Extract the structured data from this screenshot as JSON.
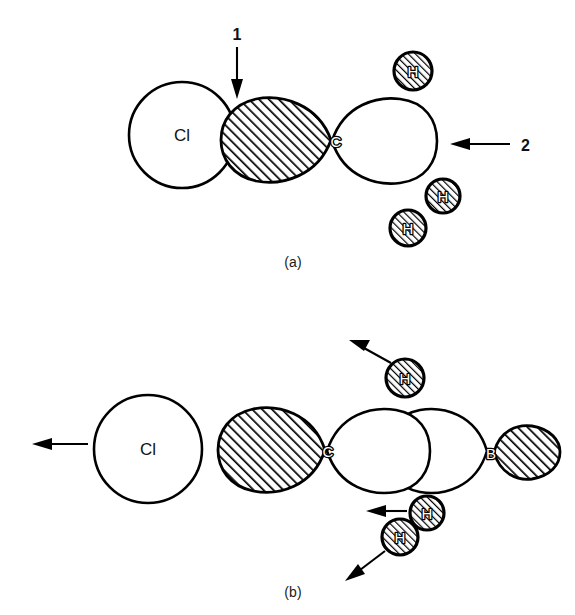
{
  "figure": {
    "background_color": "#ffffff",
    "ink_color": "#000000",
    "panels": [
      {
        "id": "a",
        "caption": "(a)",
        "atoms": [
          {
            "label": "Cl",
            "kind": "circle",
            "fill": "white"
          },
          {
            "label": "C",
            "kind": "orbital-pair",
            "left_lobe_fill": "hatched",
            "right_lobe_fill": "white"
          },
          {
            "label": "H",
            "kind": "small-circle",
            "fill": "hatched"
          },
          {
            "label": "H",
            "kind": "small-circle",
            "fill": "hatched"
          },
          {
            "label": "H",
            "kind": "small-circle",
            "fill": "hatched"
          }
        ],
        "annotations": [
          {
            "text": "1",
            "arrow": "down",
            "points_at": "overlap between Cl and carbon hatched lobe"
          },
          {
            "text": "2",
            "arrow": "left",
            "points_at": "open white lobe of carbon"
          }
        ]
      },
      {
        "id": "b",
        "caption": "(b)",
        "atoms": [
          {
            "label": "Cl",
            "kind": "circle",
            "fill": "white"
          },
          {
            "label": "C",
            "kind": "orbital-pair",
            "left_lobe_fill": "hatched",
            "right_lobe_fill": "white"
          },
          {
            "label": "B",
            "kind": "orbital-pair",
            "left_lobe_fill": "white",
            "right_lobe_fill": "hatched"
          },
          {
            "label": "H",
            "kind": "small-circle",
            "fill": "hatched"
          },
          {
            "label": "H",
            "kind": "small-circle",
            "fill": "hatched"
          },
          {
            "label": "H",
            "kind": "small-circle",
            "fill": "hatched"
          }
        ],
        "annotations": [
          {
            "text": "",
            "arrow": "left",
            "points_at": "chlorine leaving group"
          },
          {
            "text": "",
            "arrow": "up-left",
            "points_at": "upper hydrogen"
          },
          {
            "text": "",
            "arrow": "left",
            "points_at": "middle hydrogen"
          },
          {
            "text": "",
            "arrow": "down-left",
            "points_at": "lower hydrogen"
          }
        ]
      }
    ],
    "labels": {
      "cl_a": "Cl",
      "c_a": "C",
      "h_a_top": "H",
      "h_a_mid": "H",
      "h_a_low": "H",
      "num_1": "1",
      "num_2": "2",
      "caption_a": "(a)",
      "cl_b": "Cl",
      "c_b": "C",
      "b_b": "B",
      "h_b_top": "H",
      "h_b_mid": "H",
      "h_b_low": "H",
      "caption_b": "(b)"
    }
  }
}
